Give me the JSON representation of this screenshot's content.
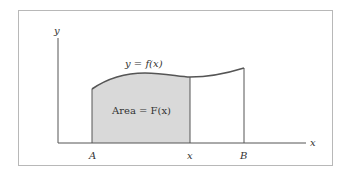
{
  "figure": {
    "y_axis_label": "y",
    "x_axis_label": "x",
    "curve_label": "y = f(x)",
    "area_label": "Area = F(x)",
    "tick_labels": {
      "a": "A",
      "x": "x",
      "b": "B"
    }
  },
  "colors": {
    "frame": "#b8b8b8",
    "axis": "#555555",
    "curve": "#555555",
    "shaded_area": "#d9d9d9",
    "text": "#333333"
  }
}
